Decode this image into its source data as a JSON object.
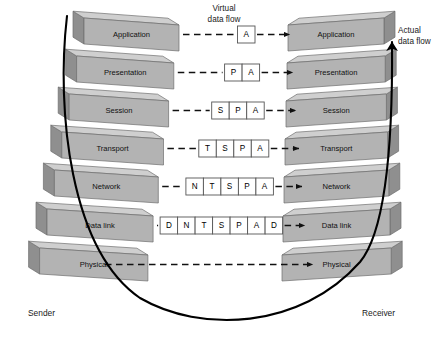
{
  "diagram": {
    "colors": {
      "slab_face": "#b3b3b3",
      "slab_top": "#cfcfcf",
      "slab_side": "#8f8f8f",
      "slab_outline": "#6e6e6e",
      "cell_fill": "#ffffff",
      "cell_stroke": "#555555",
      "dash_stroke": "#111111",
      "curve_stroke": "#000000",
      "text": "#111111",
      "background": "#ffffff"
    }
  },
  "sender": {
    "caption": "Sender",
    "layers": [
      {
        "label": "Application"
      },
      {
        "label": "Presentation"
      },
      {
        "label": "Session"
      },
      {
        "label": "Transport"
      },
      {
        "label": "Network"
      },
      {
        "label": "Data link"
      },
      {
        "label": "Physical"
      }
    ]
  },
  "receiver": {
    "caption": "Receiver",
    "layers": [
      {
        "label": "Application"
      },
      {
        "label": "Presentation"
      },
      {
        "label": "Session"
      },
      {
        "label": "Transport"
      },
      {
        "label": "Network"
      },
      {
        "label": "Data link"
      },
      {
        "label": "Physical"
      }
    ]
  },
  "annotations": {
    "virtual_flow_line1": "Virtual",
    "virtual_flow_line2": "data flow",
    "actual_flow_line1": "Actual",
    "actual_flow_line2": "data flow"
  },
  "pdus": [
    {
      "layer": "Application",
      "cells": [
        "A"
      ]
    },
    {
      "layer": "Presentation",
      "cells": [
        "P",
        "A"
      ]
    },
    {
      "layer": "Session",
      "cells": [
        "S",
        "P",
        "A"
      ]
    },
    {
      "layer": "Transport",
      "cells": [
        "T",
        "S",
        "P",
        "A"
      ]
    },
    {
      "layer": "Network",
      "cells": [
        "N",
        "T",
        "S",
        "P",
        "A"
      ]
    },
    {
      "layer": "Data link",
      "cells": [
        "D",
        "N",
        "T",
        "S",
        "P",
        "A",
        "D"
      ]
    },
    {
      "layer": "Physical",
      "cells": []
    }
  ]
}
